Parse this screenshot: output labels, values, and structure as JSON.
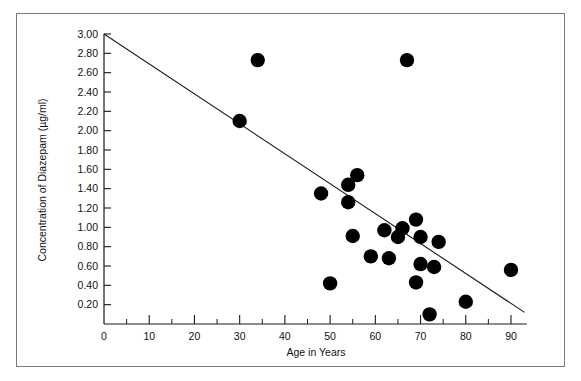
{
  "chart_data": {
    "type": "scatter",
    "title": "",
    "xlabel": "Age in Years",
    "ylabel": "Concentration of Diazepam (µg/ml)",
    "xlim": [
      0,
      93.5
    ],
    "ylim": [
      0,
      3.0
    ],
    "grid": false,
    "legend": null,
    "x_ticks_major": [
      0,
      10,
      20,
      30,
      40,
      50,
      60,
      70,
      80,
      90
    ],
    "x_tick_labels": [
      "0",
      "10",
      "20",
      "30",
      "40",
      "50",
      "60",
      "70",
      "80",
      "90"
    ],
    "x_ticks_minor": [
      5,
      15,
      25,
      35,
      45,
      55,
      65,
      75,
      85
    ],
    "y_ticks_major": [
      0.2,
      0.4,
      0.6,
      0.8,
      1.0,
      1.2,
      1.4,
      1.6,
      1.8,
      2.0,
      2.2,
      2.4,
      2.6,
      2.8,
      3.0
    ],
    "y_tick_labels": [
      "0.20",
      "0.40",
      "0.60",
      "0.80",
      "1.00",
      "1.20",
      "1.40",
      "1.60",
      "1.80",
      "2.00",
      "2.20",
      "2.40",
      "2.60",
      "2.80",
      "3.00"
    ],
    "series": [
      {
        "name": "Patients",
        "marker": "filled-circle",
        "color": "#000000",
        "points": [
          {
            "x": 34,
            "y": 2.73
          },
          {
            "x": 67,
            "y": 2.73
          },
          {
            "x": 30,
            "y": 2.1
          },
          {
            "x": 56,
            "y": 1.54
          },
          {
            "x": 54,
            "y": 1.44
          },
          {
            "x": 48,
            "y": 1.35
          },
          {
            "x": 54,
            "y": 1.26
          },
          {
            "x": 69,
            "y": 1.08
          },
          {
            "x": 66,
            "y": 0.99
          },
          {
            "x": 62,
            "y": 0.97
          },
          {
            "x": 55,
            "y": 0.91
          },
          {
            "x": 65,
            "y": 0.9
          },
          {
            "x": 70,
            "y": 0.9
          },
          {
            "x": 74,
            "y": 0.85
          },
          {
            "x": 59,
            "y": 0.7
          },
          {
            "x": 63,
            "y": 0.68
          },
          {
            "x": 70,
            "y": 0.62
          },
          {
            "x": 73,
            "y": 0.59
          },
          {
            "x": 90,
            "y": 0.56
          },
          {
            "x": 69,
            "y": 0.43
          },
          {
            "x": 50,
            "y": 0.42
          },
          {
            "x": 80,
            "y": 0.23
          },
          {
            "x": 72,
            "y": 0.1
          }
        ]
      }
    ],
    "trendline": {
      "name": "regression-line",
      "x_start": 0,
      "y_start": 3.0,
      "x_end": 93,
      "y_end": 0.12
    }
  },
  "figure": {
    "background_color": "#ffffff",
    "frame_color": "#7a7a7a",
    "point_color": "#000000",
    "axis_color": "#1a1a1a"
  }
}
